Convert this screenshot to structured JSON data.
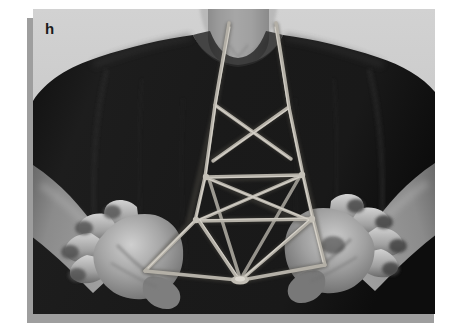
{
  "figure": {
    "panel_label": "h",
    "caption": "",
    "background_color": "#ffffff",
    "photo_background_color": "#c9c9c9",
    "shadow_color": "#9e9e9e",
    "label_color": "#1b1b1b"
  },
  "photo": {
    "description": "Grayscale photograph of a person's torso wearing a dark t-shirt, holding a string figure strung between both hands and looped around the neck",
    "subject": {
      "shirt_color": "#171717",
      "skin_color": "#9a9a9a",
      "shadow_skin_color": "#6d6d6d",
      "string_color": "#b9b5ad",
      "string_highlight_color": "#d8d4cc"
    },
    "elements": [
      {
        "name": "neck",
        "label": "neck"
      },
      {
        "name": "torso",
        "label": "torso in dark t-shirt"
      },
      {
        "name": "left-hand",
        "label": "left hand, palm up, fingers spread"
      },
      {
        "name": "right-hand",
        "label": "right hand, palm up, fingers spread"
      },
      {
        "name": "string-figure",
        "label": "multi-diamond string figure"
      }
    ]
  },
  "string_figure": {
    "type": "cats-cradle",
    "anchor_points": {
      "neck_left": [
        196,
        22
      ],
      "neck_right": [
        243,
        22
      ],
      "left_hand": [
        112,
        262
      ],
      "right_hand": [
        292,
        256
      ],
      "bottom_knot": [
        207,
        272
      ]
    },
    "crossings": 4,
    "diamonds": 3
  }
}
